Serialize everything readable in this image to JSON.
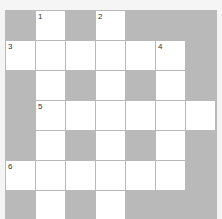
{
  "puzzle": {
    "type": "crossword",
    "rows": 7,
    "cols": 7,
    "colors": {
      "block": "#b9b9b9",
      "open": "#ffffff",
      "background": "#f5f5f5"
    },
    "grid": [
      [
        "B",
        "W",
        "B",
        "W",
        "B",
        "B",
        "B"
      ],
      [
        "W",
        "W",
        "W",
        "W",
        "W",
        "W",
        "B"
      ],
      [
        "B",
        "W",
        "B",
        "W",
        "B",
        "W",
        "B"
      ],
      [
        "B",
        "W",
        "W",
        "W",
        "W",
        "W",
        "W"
      ],
      [
        "B",
        "W",
        "B",
        "W",
        "B",
        "W",
        "B"
      ],
      [
        "W",
        "W",
        "W",
        "W",
        "W",
        "W",
        "B"
      ],
      [
        "B",
        "W",
        "B",
        "W",
        "B",
        "B",
        "B"
      ]
    ],
    "numbers": [
      {
        "row": 0,
        "col": 1,
        "label": "1"
      },
      {
        "row": 0,
        "col": 3,
        "label": "2"
      },
      {
        "row": 1,
        "col": 0,
        "label": "3"
      },
      {
        "row": 1,
        "col": 5,
        "label": "4"
      },
      {
        "row": 3,
        "col": 1,
        "label": "5"
      },
      {
        "row": 5,
        "col": 0,
        "label": "6"
      }
    ]
  }
}
